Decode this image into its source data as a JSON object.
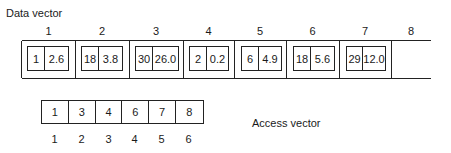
{
  "data_vector": {
    "label": "Data vector",
    "indices": [
      "1",
      "2",
      "3",
      "4",
      "5",
      "6",
      "7",
      "8"
    ],
    "cells": [
      {
        "key": "1",
        "value": "2.6"
      },
      {
        "key": "18",
        "value": "3.8"
      },
      {
        "key": "30",
        "value": "26.0"
      },
      {
        "key": "2",
        "value": "0.2"
      },
      {
        "key": "6",
        "value": "4.9"
      },
      {
        "key": "18",
        "value": "5.6"
      },
      {
        "key": "29",
        "value": "12.0"
      },
      null
    ]
  },
  "access_vector": {
    "label": "Access vector",
    "values": [
      "1",
      "3",
      "4",
      "6",
      "7",
      "8"
    ],
    "indices": [
      "1",
      "2",
      "3",
      "4",
      "5",
      "6"
    ]
  }
}
